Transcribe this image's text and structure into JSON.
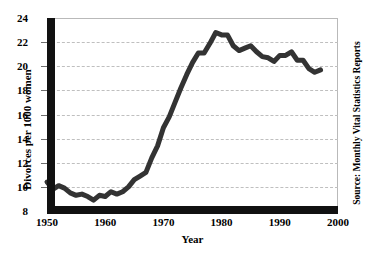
{
  "chart_data": {
    "type": "line",
    "title": "",
    "xlabel": "Year",
    "ylabel": "Divorces per 1000 women",
    "source": "Source: Monthly Vital Statistics Reports",
    "xlim": [
      1950,
      2000
    ],
    "ylim": [
      8,
      24
    ],
    "xticks": [
      1950,
      1960,
      1970,
      1980,
      1990,
      2000
    ],
    "yticks": [
      8,
      10,
      12,
      14,
      16,
      18,
      20,
      22,
      24
    ],
    "grid": "horizontal-dashed",
    "legend": "none",
    "series_color": "#333333",
    "series": [
      {
        "name": "Divorces per 1000 women",
        "x": [
          1950,
          1951,
          1952,
          1953,
          1954,
          1955,
          1956,
          1957,
          1958,
          1959,
          1960,
          1961,
          1962,
          1963,
          1964,
          1965,
          1966,
          1967,
          1968,
          1969,
          1970,
          1971,
          1972,
          1973,
          1974,
          1975,
          1976,
          1977,
          1978,
          1979,
          1980,
          1981,
          1982,
          1983,
          1984,
          1985,
          1986,
          1987,
          1988,
          1989,
          1990,
          1991,
          1992,
          1993,
          1994,
          1995,
          1996,
          1997
        ],
        "values": [
          10.4,
          9.8,
          10.1,
          9.9,
          9.5,
          9.3,
          9.4,
          9.2,
          8.9,
          9.3,
          9.2,
          9.6,
          9.4,
          9.6,
          10.0,
          10.6,
          10.9,
          11.2,
          12.4,
          13.4,
          14.9,
          15.8,
          17.0,
          18.2,
          19.3,
          20.3,
          21.1,
          21.1,
          21.9,
          22.8,
          22.6,
          22.6,
          21.7,
          21.3,
          21.5,
          21.7,
          21.2,
          20.8,
          20.7,
          20.4,
          20.9,
          20.9,
          21.2,
          20.5,
          20.5,
          19.8,
          19.5,
          19.7
        ]
      }
    ]
  },
  "axes": {
    "y_title": "Divorces per 1000 women",
    "x_title": "Year"
  },
  "annotations": {
    "source": "Source: Monthly Vital Statistics Reports"
  }
}
